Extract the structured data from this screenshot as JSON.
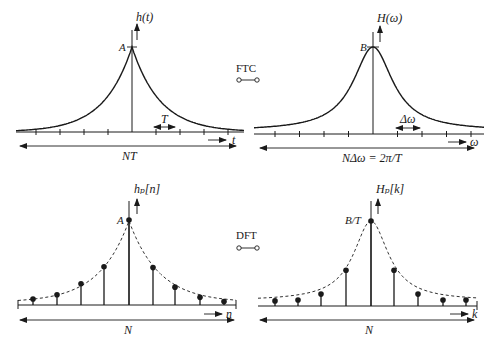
{
  "diagram": {
    "panels": {
      "top_left": {
        "y_label": "h(t)",
        "peak_label": "A",
        "x_label": "t",
        "spacing_label": "T",
        "span_label": "NT",
        "function": "two-sided exponential decay",
        "ticks_each_side": 4
      },
      "top_right": {
        "y_label": "H(ω)",
        "peak_label": "B",
        "x_label": "ω",
        "spacing_label": "Δω",
        "span_label": "NΔω = 2π/T",
        "function": "Lorentzian",
        "ticks_each_side": 4
      },
      "bottom_left": {
        "y_label": "hₚ[n]",
        "peak_label": "A",
        "x_label": "n",
        "span_label": "N",
        "samples": [
          0.07,
          0.12,
          0.25,
          0.45,
          1.0,
          0.44,
          0.21,
          0.09,
          0.04
        ]
      },
      "bottom_right": {
        "y_label": "Hₚ[k]",
        "peak_label": "B/T",
        "x_label": "k",
        "span_label": "N",
        "samples": [
          0.06,
          0.07,
          0.14,
          0.42,
          1.0,
          0.42,
          0.14,
          0.07,
          0.07
        ]
      }
    },
    "transforms": {
      "continuous": "FTC",
      "discrete": "DFT"
    }
  }
}
